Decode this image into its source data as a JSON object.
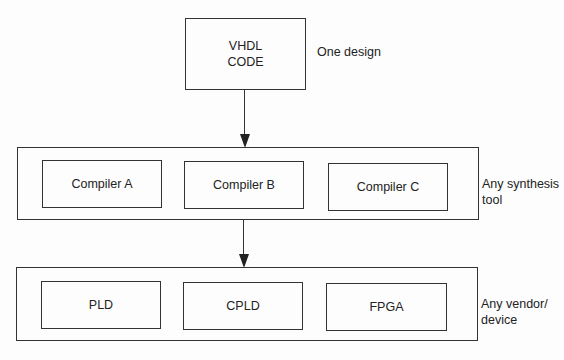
{
  "design": {
    "box_text_line1": "VHDL",
    "box_text_line2": "CODE",
    "side_label": "One design"
  },
  "synthesis": {
    "compilers": [
      "Compiler A",
      "Compiler B",
      "Compiler C"
    ],
    "side_label_line1": "Any synthesis",
    "side_label_line2": "tool"
  },
  "devices": {
    "items": [
      "PLD",
      "CPLD",
      "FPGA"
    ],
    "side_label_line1": "Any vendor/",
    "side_label_line2": "device"
  }
}
